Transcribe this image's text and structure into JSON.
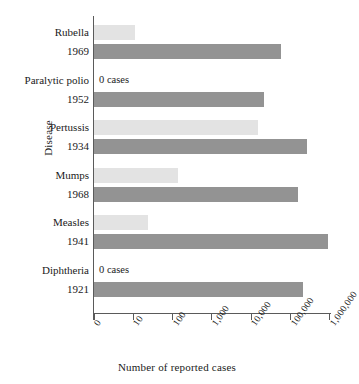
{
  "chart_data": {
    "type": "bar",
    "orientation": "horizontal",
    "title": "",
    "xlabel": "Number of reported cases",
    "ylabel": "Disease",
    "xscale": "log",
    "xlim": [
      0,
      1000000
    ],
    "xticks": [
      0,
      10,
      100,
      1000,
      10000,
      100000,
      1000000
    ],
    "xtick_labels": [
      "0",
      "10",
      "100",
      "1,000",
      "10,000",
      "100,000",
      "1,000,000"
    ],
    "grid": false,
    "legend": "none",
    "colors": {
      "recent_bar": "#e3e3e3",
      "peak_bar": "#939393",
      "axis": "#5a5a5a",
      "text": "#1a1a1a",
      "background": "#ffffff"
    },
    "categories": [
      "Rubella",
      "Paralytic polio",
      "Pertussis",
      "Mumps",
      "Measles",
      "Diphtheria"
    ],
    "groups": [
      {
        "disease": "Rubella",
        "recent": {
          "label": "Rubella",
          "value": 11,
          "zero": false,
          "zero_text": ""
        },
        "peak": {
          "label": "1969",
          "value": 58000
        }
      },
      {
        "disease": "Paralytic polio",
        "recent": {
          "label": "Paralytic polio",
          "value": 0,
          "zero": true,
          "zero_text": "0 cases"
        },
        "peak": {
          "label": "1952",
          "value": 21000
        }
      },
      {
        "disease": "Pertussis",
        "recent": {
          "label": "Pertussis",
          "value": 15000,
          "zero": false,
          "zero_text": ""
        },
        "peak": {
          "label": "1934",
          "value": 265000
        }
      },
      {
        "disease": "Mumps",
        "recent": {
          "label": "Mumps",
          "value": 140,
          "zero": false,
          "zero_text": ""
        },
        "peak": {
          "label": "1968",
          "value": 152000
        }
      },
      {
        "disease": "Measles",
        "recent": {
          "label": "Measles",
          "value": 24,
          "zero": false,
          "zero_text": ""
        },
        "peak": {
          "label": "1941",
          "value": 900000
        }
      },
      {
        "disease": "Diphtheria",
        "recent": {
          "label": "Diphtheria",
          "value": 0,
          "zero": true,
          "zero_text": "0 cases"
        },
        "peak": {
          "label": "1921",
          "value": 206000
        }
      }
    ]
  },
  "axes": {
    "y_title": "Disease",
    "x_title": "Number of reported cases",
    "x_tick_labels": [
      "0",
      "10",
      "100",
      "1,000",
      "10,000",
      "100,000",
      "1,000,000"
    ]
  }
}
